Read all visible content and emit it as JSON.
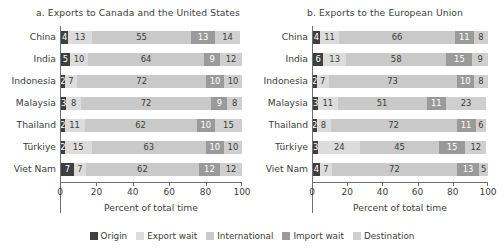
{
  "chart_data": {
    "type": "bar",
    "title": "",
    "orientation": "horizontal",
    "stacked": true,
    "stacked_mode": "percent",
    "xlabel": "Percent of total time",
    "ylabel": "",
    "xlim": [
      0,
      100
    ],
    "xticks": [
      0,
      20,
      40,
      60,
      80,
      100
    ],
    "grid": false,
    "legend_position": "bottom",
    "series": [
      {
        "name": "Origin",
        "color": "#3f3f3f"
      },
      {
        "name": "Export wait",
        "color": "#dcdcdc"
      },
      {
        "name": "International",
        "color": "#c9c9c9"
      },
      {
        "name": "Import wait",
        "color": "#9a9a9a"
      },
      {
        "name": "Destination",
        "color": "#cfcfcf"
      }
    ],
    "panels": [
      {
        "title": "a. Exports to Canada and the United States",
        "categories": [
          "China",
          "India",
          "Indonesia",
          "Malaysia",
          "Thailand",
          "Türkiye",
          "Viet Nam"
        ],
        "values": [
          [
            4,
            13,
            55,
            13,
            14
          ],
          [
            5,
            10,
            64,
            9,
            12
          ],
          [
            2,
            7,
            72,
            10,
            10
          ],
          [
            3,
            8,
            72,
            9,
            8
          ],
          [
            2,
            11,
            62,
            10,
            15
          ],
          [
            2,
            15,
            63,
            10,
            10
          ],
          [
            7,
            7,
            62,
            12,
            12
          ]
        ]
      },
      {
        "title": "b. Exports to the European Union",
        "categories": [
          "China",
          "India",
          "Indonesia",
          "Malaysia",
          "Thailand",
          "Türkiye",
          "Viet Nam"
        ],
        "values": [
          [
            4,
            11,
            66,
            11,
            8
          ],
          [
            6,
            13,
            58,
            15,
            9
          ],
          [
            2,
            7,
            73,
            10,
            8
          ],
          [
            3,
            11,
            51,
            11,
            23
          ],
          [
            2,
            8,
            72,
            11,
            6
          ],
          [
            3,
            24,
            45,
            15,
            12
          ],
          [
            4,
            7,
            72,
            13,
            5
          ]
        ]
      }
    ]
  },
  "panel_a": {
    "title": "a. Exports to Canada and the United States",
    "xlabel": "Percent of total time",
    "ylabels": [
      "China",
      "India",
      "Indonesia",
      "Malaysia",
      "Thailand",
      "Türkiye",
      "Viet Nam"
    ],
    "xticklabels": [
      "0",
      "20",
      "40",
      "60",
      "80",
      "100"
    ]
  },
  "panel_b": {
    "title": "b. Exports to the European Union",
    "xlabel": "Percent of total time",
    "ylabels": [
      "China",
      "India",
      "Indonesia",
      "Malaysia",
      "Thailand",
      "Türkiye",
      "Viet Nam"
    ],
    "xticklabels": [
      "0",
      "20",
      "40",
      "60",
      "80",
      "100"
    ]
  },
  "legend": {
    "items": [
      {
        "label": "Origin",
        "color": "#3f3f3f"
      },
      {
        "label": "Export wait",
        "color": "#dcdcdc"
      },
      {
        "label": "International",
        "color": "#c9c9c9"
      },
      {
        "label": "Import wait",
        "color": "#9a9a9a"
      },
      {
        "label": "Destination",
        "color": "#cfcfcf"
      }
    ]
  }
}
